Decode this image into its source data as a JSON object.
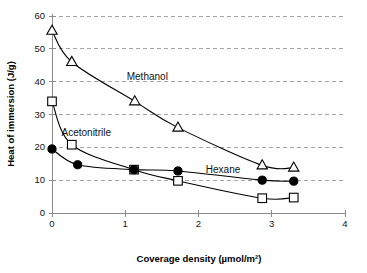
{
  "chart_data": {
    "type": "line",
    "title": "",
    "xlabel": "Coverage density (µmol/m²)",
    "ylabel": "Heat of immersion (J/g)",
    "xlim": [
      0,
      4
    ],
    "ylim": [
      0,
      60
    ],
    "xticks": [
      0,
      1,
      2,
      3,
      4
    ],
    "xtick_labels": [
      "0",
      "1",
      "2",
      "3",
      "4"
    ],
    "yticks": [
      0,
      10,
      20,
      30,
      40,
      50,
      60
    ],
    "ytick_labels": [
      "0",
      "10",
      "20",
      "30",
      "40",
      "50",
      "60"
    ],
    "grid": "horizontal-dashed",
    "legend": "inline-annotations",
    "series": [
      {
        "name": "Methanol",
        "marker": "open-triangle",
        "label_x": 1.02,
        "label_y": 40.6,
        "x": [
          0.0,
          0.27,
          1.13,
          1.72,
          2.87,
          3.3
        ],
        "y": [
          55.5,
          46.0,
          34.0,
          26.0,
          14.5,
          13.8
        ]
      },
      {
        "name": "Acetonitrile",
        "marker": "open-square",
        "label_x": 0.13,
        "label_y": 23.6,
        "x": [
          0.0,
          0.27,
          1.12,
          1.72,
          2.87,
          3.3
        ],
        "y": [
          34.0,
          20.8,
          13.2,
          9.8,
          4.5,
          4.7
        ]
      },
      {
        "name": "Hexane",
        "marker": "filled-circle",
        "label_x": 2.1,
        "label_y": 12.3,
        "x": [
          0.0,
          0.35,
          1.12,
          1.72,
          2.87,
          3.3
        ],
        "y": [
          19.5,
          14.7,
          13.2,
          12.8,
          10.0,
          9.7
        ]
      }
    ]
  },
  "colors": {
    "background": "#ffffff",
    "axis": "#8c8c8c",
    "grid": "#9a9a9a",
    "curve": "#000000",
    "text": "#111111"
  }
}
